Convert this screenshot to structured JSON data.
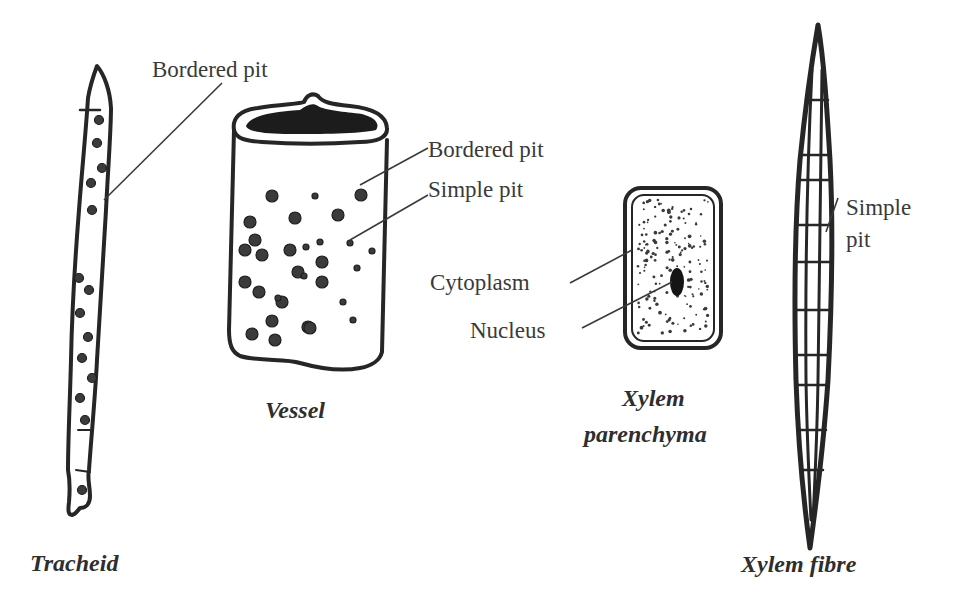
{
  "diagram": {
    "elements": [
      {
        "id": "tracheid",
        "title": "Tracheid",
        "labels": [
          "Bordered pit"
        ]
      },
      {
        "id": "vessel",
        "title": "Vessel",
        "labels": [
          "Bordered pit",
          "Simple pit"
        ]
      },
      {
        "id": "xylem-parenchyma",
        "title_line1": "Xylem",
        "title_line2": "parenchyma",
        "labels": [
          "Cytoplasm",
          "Nucleus"
        ]
      },
      {
        "id": "xylem-fibre",
        "title": "Xylem fibre",
        "labels_line1": "Simple",
        "labels_line2": "pit"
      }
    ]
  },
  "colors": {
    "ink": "#262626",
    "text": "#3a3a3a",
    "background": "#ffffff"
  }
}
